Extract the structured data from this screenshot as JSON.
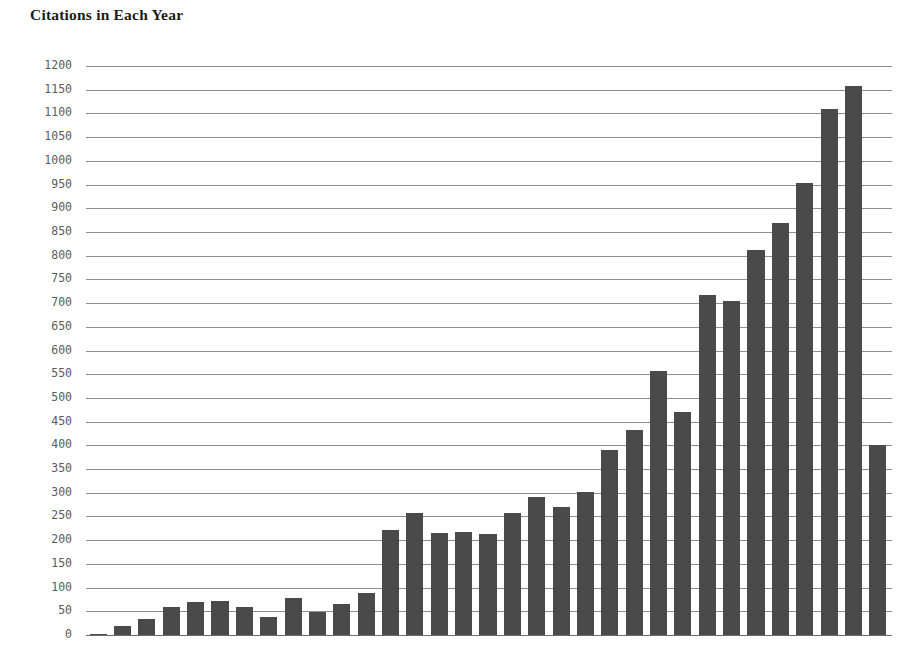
{
  "chart_title": "Citations in Each Year",
  "chart_data": {
    "type": "bar",
    "title": "Citations in Each Year",
    "xlabel": "",
    "ylabel": "",
    "ylim": [
      0,
      1200
    ],
    "ytick_step": 50,
    "yticks": [
      1200,
      1150,
      1100,
      1050,
      1000,
      950,
      900,
      850,
      800,
      750,
      700,
      650,
      600,
      550,
      500,
      450,
      400,
      350,
      300,
      250,
      200,
      150,
      100,
      50,
      0
    ],
    "grid": true,
    "legend": null,
    "bar_color": "#4a4a4a",
    "grid_color": "#8e8e8e",
    "categories": [
      "1",
      "2",
      "3",
      "4",
      "5",
      "6",
      "7",
      "8",
      "9",
      "10",
      "11",
      "12",
      "13",
      "14",
      "15",
      "16",
      "17",
      "18",
      "19",
      "20",
      "21",
      "22",
      "23",
      "24",
      "25",
      "26",
      "27",
      "28",
      "29",
      "30",
      "31",
      "32",
      "33"
    ],
    "values": [
      3,
      20,
      33,
      58,
      70,
      71,
      59,
      38,
      77,
      48,
      66,
      88,
      221,
      258,
      216,
      218,
      212,
      258,
      292,
      270,
      302,
      390,
      433,
      557,
      470,
      717,
      705,
      812,
      868,
      953,
      1110,
      1157,
      400
    ]
  }
}
